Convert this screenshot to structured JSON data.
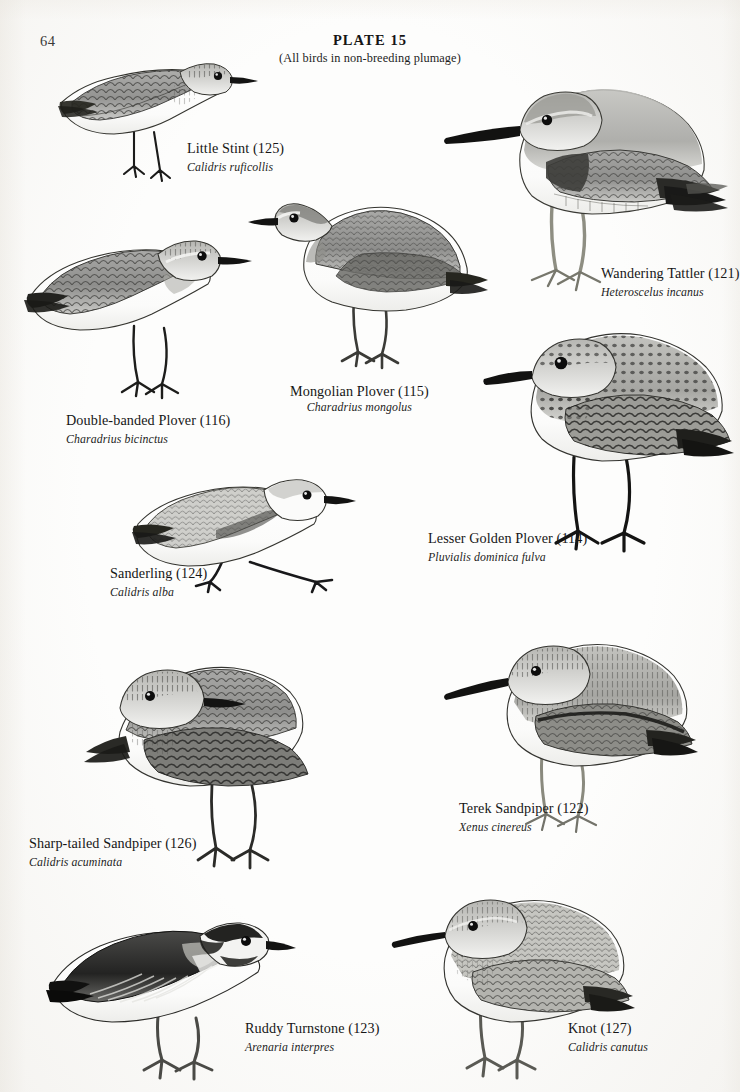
{
  "page": {
    "number": "64",
    "plate_title": "PLATE 15",
    "plate_subtitle": "(All birds in non-breeding plumage)",
    "ink_color": "#1a1a1a",
    "paper_color": "#fdfdfc"
  },
  "species": [
    {
      "id": "little-stint",
      "common_name": "Little Stint (125)",
      "scientific_name": "Calidris ruficollis",
      "plate_number": "125"
    },
    {
      "id": "wandering-tattler",
      "common_name": "Wandering Tattler (121)",
      "scientific_name": "Heteroscelus incanus",
      "plate_number": "121"
    },
    {
      "id": "double-banded-plover",
      "common_name": "Double-banded Plover (116)",
      "scientific_name": "Charadrius bicinctus",
      "plate_number": "116"
    },
    {
      "id": "mongolian-plover",
      "common_name": "Mongolian Plover (115)",
      "scientific_name": "Charadrius mongolus",
      "plate_number": "115"
    },
    {
      "id": "lesser-golden-plover",
      "common_name": "Lesser Golden Plover (114)",
      "scientific_name": "Pluvialis dominica fulva",
      "plate_number": "114"
    },
    {
      "id": "sanderling",
      "common_name": "Sanderling (124)",
      "scientific_name": "Calidris alba",
      "plate_number": "124"
    },
    {
      "id": "sharp-tailed-sandpiper",
      "common_name": "Sharp-tailed Sandpiper (126)",
      "scientific_name": "Calidris acuminata",
      "plate_number": "126"
    },
    {
      "id": "terek-sandpiper",
      "common_name": "Terek Sandpiper (122)",
      "scientific_name": "Xenus cinereus",
      "plate_number": "122"
    },
    {
      "id": "ruddy-turnstone",
      "common_name": "Ruddy Turnstone (123)",
      "scientific_name": "Arenaria interpres",
      "plate_number": "123"
    },
    {
      "id": "knot",
      "common_name": "Knot (127)",
      "scientific_name": "Calidris canutus",
      "plate_number": "127"
    }
  ]
}
